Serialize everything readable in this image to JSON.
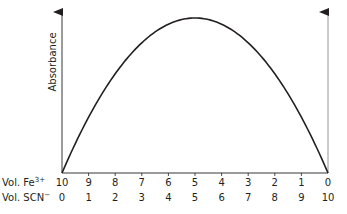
{
  "chart_data": {
    "type": "line",
    "title": "",
    "ylabel": "Absorbance",
    "xlabel": "",
    "x_axis_rows": [
      {
        "label": "Vol. Fe",
        "superscript": "3+",
        "ticks": [
          "10",
          "9",
          "8",
          "7",
          "6",
          "5",
          "4",
          "3",
          "2",
          "1",
          "0"
        ]
      },
      {
        "label": "Vol. SCN",
        "superscript": "−",
        "ticks": [
          "0",
          "1",
          "2",
          "3",
          "4",
          "5",
          "6",
          "7",
          "8",
          "9",
          "10"
        ]
      }
    ],
    "x": [
      0,
      1,
      2,
      3,
      4,
      5,
      6,
      7,
      8,
      9,
      10
    ],
    "series": [
      {
        "name": "Absorbance",
        "values": [
          0,
          0.36,
          0.64,
          0.84,
          0.96,
          1.0,
          0.96,
          0.84,
          0.64,
          0.36,
          0
        ]
      }
    ],
    "ylim": [
      0,
      1.05
    ],
    "xlim": [
      0,
      10
    ],
    "grid": false,
    "legend": null,
    "annotations": [],
    "colors": {
      "curve": "#231f20",
      "axis": "#231f20",
      "right_axis": "#8a8a8a"
    }
  }
}
